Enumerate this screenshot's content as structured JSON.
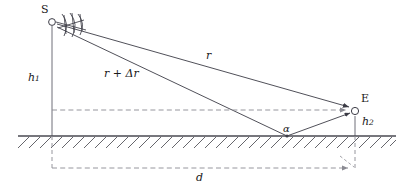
{
  "figure": {
    "type": "two-ray-ground-reflection-propagation-diagram",
    "background_color": "#ffffff",
    "line_color": "#3c3c46",
    "ground_color": "#4a4a52",
    "dash_color": "#8a8a92",
    "text_color": "#1a1a1a"
  },
  "labels": {
    "source": "S",
    "receiver": "E",
    "height_transmitter": "h",
    "height_transmitter_sub": "1",
    "height_receiver": "h",
    "height_receiver_sub": "2",
    "direct_path": "r",
    "reflected_path": "r + Δr",
    "grazing_angle": "α",
    "distance": "d"
  },
  "geometry": {
    "source_point": {
      "x": 52,
      "y": 22
    },
    "receiver_point": {
      "x": 355,
      "y": 110
    },
    "reflection_point": {
      "x": 287,
      "y": 136
    },
    "ground_line_y": 136,
    "ground_line_x1": 18,
    "ground_line_x2": 396,
    "dimension_line_y": 168,
    "dimension_x1": 52,
    "dimension_x2": 355,
    "horizontal_dashed_y": 110,
    "horizontal_dashed_x1": 52,
    "horizontal_dashed_x2": 352
  }
}
